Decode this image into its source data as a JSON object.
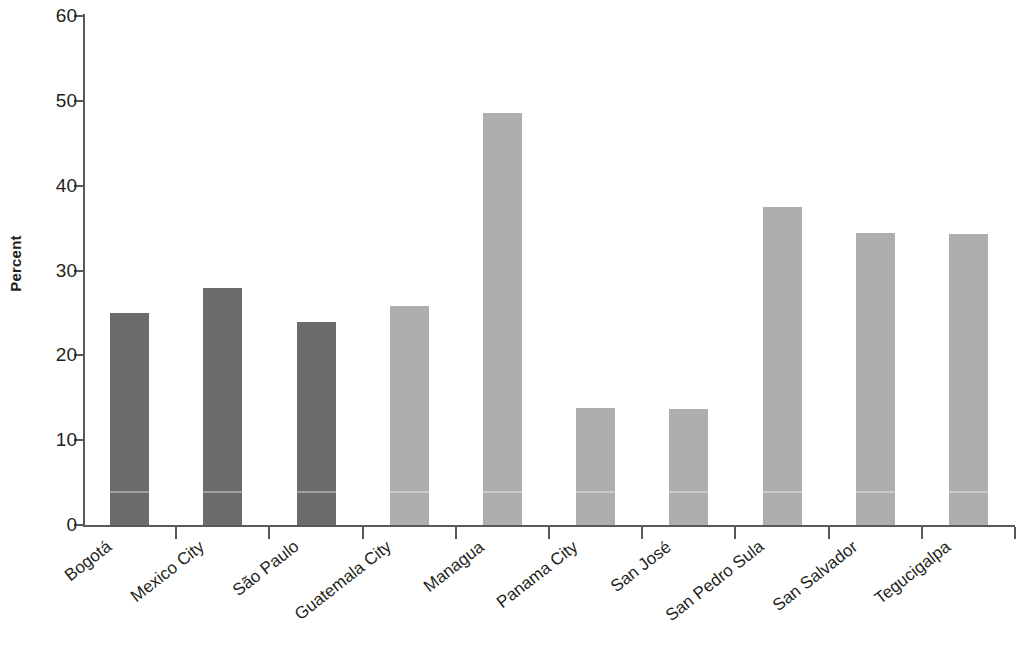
{
  "chart_data": {
    "type": "bar",
    "title": "",
    "subtitle": "",
    "xlabel": "",
    "ylabel": "Percent",
    "ylim": [
      0,
      60
    ],
    "yticks": [
      0,
      10,
      20,
      30,
      40,
      50,
      60
    ],
    "ytick_labels": [
      "0",
      "10",
      "20",
      "30",
      "40",
      "50",
      "60"
    ],
    "grid": false,
    "legend": null,
    "categories": [
      "Bogotá",
      "Mexico City",
      "São Paulo",
      "Guatemala City",
      "Managua",
      "Panama City",
      "San José",
      "San Pedro Sula",
      "San Salvador",
      "Tegucigalpa"
    ],
    "values": [
      25.0,
      27.9,
      23.9,
      25.8,
      48.6,
      13.8,
      13.7,
      37.5,
      34.4,
      34.3
    ],
    "bar_colors": [
      "#6b6b6b",
      "#6b6b6b",
      "#6b6b6b",
      "#aeaeae",
      "#aeaeae",
      "#aeaeae",
      "#aeaeae",
      "#aeaeae",
      "#aeaeae",
      "#aeaeae"
    ],
    "color_groups": [
      {
        "name": "dark-gray-group",
        "color": "#6b6b6b",
        "categories": [
          "Bogotá",
          "Mexico City",
          "São Paulo"
        ]
      },
      {
        "name": "light-gray-group",
        "color": "#aeaeae",
        "categories": [
          "Guatemala City",
          "Managua",
          "Panama City",
          "San José",
          "San Pedro Sula",
          "San Salvador",
          "Tegucigalpa"
        ]
      }
    ],
    "axis_color": "#58595b",
    "text_color": "#231f20",
    "background": "#ffffff"
  }
}
